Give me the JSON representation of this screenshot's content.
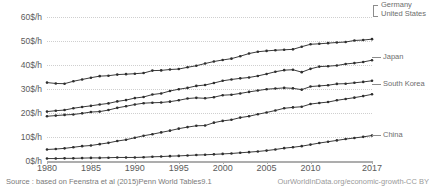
{
  "chart_data": {
    "type": "line",
    "title": "",
    "subtitle": "",
    "xlabel": "",
    "ylabel": "",
    "xlim": [
      1980,
      2017
    ],
    "ylim": [
      0,
      65
    ],
    "grid": true,
    "legend_position": "right-inline",
    "y_ticks": [
      0,
      10,
      20,
      30,
      40,
      50,
      60
    ],
    "y_tick_labels": [
      "0$/h",
      "10$/h",
      "20$/h",
      "30$/h",
      "40$/h",
      "50$/h",
      "60$/h"
    ],
    "x_ticks": [
      1980,
      1985,
      1990,
      1995,
      2000,
      2005,
      2010,
      2017
    ],
    "x_tick_labels": [
      "1980",
      "1985",
      "1990",
      "1995",
      "2000",
      "2005",
      "2010",
      "2017"
    ],
    "x": [
      1980,
      1981,
      1982,
      1983,
      1984,
      1985,
      1986,
      1987,
      1988,
      1989,
      1990,
      1991,
      1992,
      1993,
      1994,
      1995,
      1996,
      1997,
      1998,
      1999,
      2000,
      2001,
      2002,
      2003,
      2004,
      2005,
      2006,
      2007,
      2008,
      2009,
      2010,
      2011,
      2012,
      2013,
      2014,
      2015,
      2016,
      2017
    ],
    "series": [
      {
        "name": "United States",
        "color": "#2e2e2e",
        "values": [
          35.4,
          35.0,
          34.9,
          36.0,
          36.8,
          37.6,
          38.3,
          38.5,
          39.0,
          39.2,
          39.4,
          39.7,
          40.8,
          40.9,
          41.3,
          41.5,
          42.3,
          43.0,
          44.0,
          44.9,
          45.6,
          46.2,
          47.3,
          48.5,
          49.3,
          49.7,
          50.0,
          50.2,
          50.4,
          51.6,
          52.7,
          52.9,
          53.2,
          53.5,
          53.7,
          54.4,
          54.6,
          55.0
        ]
      },
      {
        "name": "Germany",
        "color": "#2e2e2e",
        "values": [
          22.3,
          22.7,
          23.0,
          23.8,
          24.4,
          24.9,
          25.5,
          26.0,
          26.9,
          27.5,
          28.4,
          28.9,
          30.0,
          30.5,
          31.6,
          32.4,
          33.0,
          33.9,
          34.3,
          35.2,
          36.2,
          36.8,
          37.3,
          37.7,
          38.4,
          39.3,
          40.3,
          41.0,
          41.2,
          40.1,
          41.6,
          42.6,
          42.8,
          43.1,
          43.8,
          44.2,
          44.7,
          45.5
        ]
      },
      {
        "name": "Japan",
        "color": "#2e2e2e",
        "values": [
          20.2,
          20.5,
          20.8,
          21.0,
          21.5,
          22.1,
          22.3,
          23.0,
          24.0,
          24.7,
          25.5,
          26.1,
          26.3,
          26.4,
          26.8,
          27.4,
          28.2,
          28.5,
          28.3,
          28.8,
          29.7,
          29.9,
          30.5,
          31.2,
          31.8,
          32.4,
          32.7,
          33.0,
          32.8,
          32.2,
          33.6,
          33.9,
          34.2,
          34.8,
          34.9,
          35.3,
          35.7,
          36.2
        ]
      },
      {
        "name": "South Korea",
        "color": "#2e2e2e",
        "values": [
          5.2,
          5.4,
          5.7,
          6.2,
          6.7,
          7.0,
          7.6,
          8.2,
          9.0,
          9.6,
          10.5,
          11.4,
          12.1,
          12.9,
          13.7,
          14.6,
          15.3,
          15.9,
          16.0,
          17.3,
          18.1,
          18.6,
          19.6,
          20.2,
          21.1,
          21.9,
          22.8,
          23.8,
          24.2,
          24.5,
          25.7,
          26.2,
          26.6,
          27.4,
          28.0,
          28.6,
          29.3,
          30.1
        ]
      },
      {
        "name": "China",
        "color": "#2e2e2e",
        "values": [
          1.1,
          1.1,
          1.2,
          1.2,
          1.3,
          1.4,
          1.4,
          1.5,
          1.6,
          1.6,
          1.6,
          1.7,
          1.9,
          2.0,
          2.2,
          2.3,
          2.5,
          2.7,
          2.8,
          3.0,
          3.2,
          3.4,
          3.7,
          4.0,
          4.3,
          4.7,
          5.2,
          5.8,
          6.2,
          6.7,
          7.4,
          8.1,
          8.7,
          9.3,
          9.9,
          10.4,
          10.9,
          11.5
        ]
      }
    ]
  },
  "labels": {
    "germany": "Germany",
    "united_states": "United States",
    "japan": "Japan",
    "south_korea": "South Korea",
    "china": "China"
  },
  "footer": {
    "source": "Source : based on Feenstra et al (2015)Penn World Tables9.1",
    "attribution": "OurWorldInData.org/economic-growth-CC BY"
  }
}
